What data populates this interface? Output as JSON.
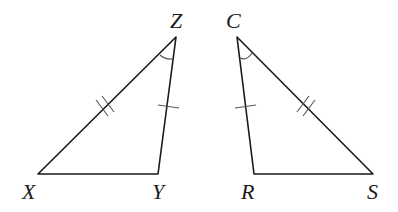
{
  "diagram": {
    "type": "congruent-triangles",
    "colors": {
      "stroke": "#1a1a1a",
      "mark": "#555555",
      "background": "#ffffff"
    },
    "triangles": [
      {
        "name": "triangle-XYZ",
        "vertices": {
          "X": {
            "label": "X",
            "x": 38,
            "y": 174
          },
          "Y": {
            "label": "Y",
            "x": 158,
            "y": 174
          },
          "Z": {
            "label": "Z",
            "x": 176,
            "y": 37
          }
        },
        "marks": {
          "XZ": "double-tick",
          "YZ": "single-tick",
          "angle_Z": "single-arc"
        }
      },
      {
        "name": "triangle-CRS",
        "vertices": {
          "C": {
            "label": "C",
            "x": 237,
            "y": 37
          },
          "R": {
            "label": "R",
            "x": 254,
            "y": 174
          },
          "S": {
            "label": "S",
            "x": 373,
            "y": 174
          }
        },
        "marks": {
          "CS": "double-tick",
          "CR": "single-tick",
          "angle_C": "single-arc"
        }
      }
    ],
    "labels": {
      "X": "X",
      "Y": "Y",
      "Z": "Z",
      "C": "C",
      "R": "R",
      "S": "S"
    }
  }
}
